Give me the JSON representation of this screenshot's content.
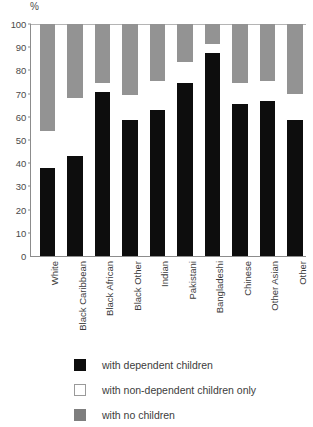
{
  "chart_data": {
    "type": "bar",
    "subtype": "stacked-percentage",
    "title": "",
    "xlabel": "",
    "ylabel": "%",
    "ylim": [
      0,
      100
    ],
    "yticks": [
      0,
      10,
      20,
      30,
      40,
      50,
      60,
      70,
      80,
      90,
      100
    ],
    "ytick_labels": [
      "0",
      "10",
      "20",
      "30",
      "40",
      "50",
      "60",
      "70",
      "80",
      "90",
      "100"
    ],
    "unit_label": "%",
    "grid": false,
    "legend_position": "bottom-left",
    "categories": [
      "White",
      "Black Caribbean",
      "Black African",
      "Black Other",
      "Indian",
      "Pakistani",
      "Bangladeshi",
      "Chinese",
      "Other Asian",
      "Other"
    ],
    "series": [
      {
        "name": "with dependent children",
        "color": "#0d0d0d",
        "values": [
          38,
          43,
          70.5,
          58.5,
          63,
          74.5,
          87.5,
          65.5,
          67,
          58.5
        ]
      },
      {
        "name": "with non-dependent children only",
        "color": "#ffffff",
        "values": [
          16,
          25,
          4,
          11,
          12.5,
          9,
          4,
          9,
          8.5,
          11.5
        ]
      },
      {
        "name": "with no children",
        "color": "#939393",
        "values": [
          46,
          32,
          25.5,
          30.5,
          24.5,
          16.5,
          8.5,
          25.5,
          24.5,
          30
        ]
      }
    ],
    "cumulative_tops": [
      [
        38,
        54,
        100
      ],
      [
        43,
        68,
        100
      ],
      [
        70.5,
        74.5,
        100
      ],
      [
        58.5,
        69.5,
        100
      ],
      [
        63,
        75.5,
        100
      ],
      [
        74.5,
        83.5,
        100
      ],
      [
        87.5,
        91.5,
        100
      ],
      [
        65.5,
        74.5,
        100
      ],
      [
        67,
        75.5,
        100
      ],
      [
        58.5,
        70,
        100
      ]
    ]
  },
  "legend": {
    "items": [
      {
        "label": "with dependent children",
        "swatch": "black"
      },
      {
        "label": "with non-dependent children only",
        "swatch": "white"
      },
      {
        "label": "with no children",
        "swatch": "gray"
      }
    ]
  },
  "colors": {
    "dependent": "#0d0d0d",
    "non_dependent": "#ffffff",
    "no_children": "#939393",
    "axis": "#8c8c8c",
    "text": "#3c3c3c"
  }
}
